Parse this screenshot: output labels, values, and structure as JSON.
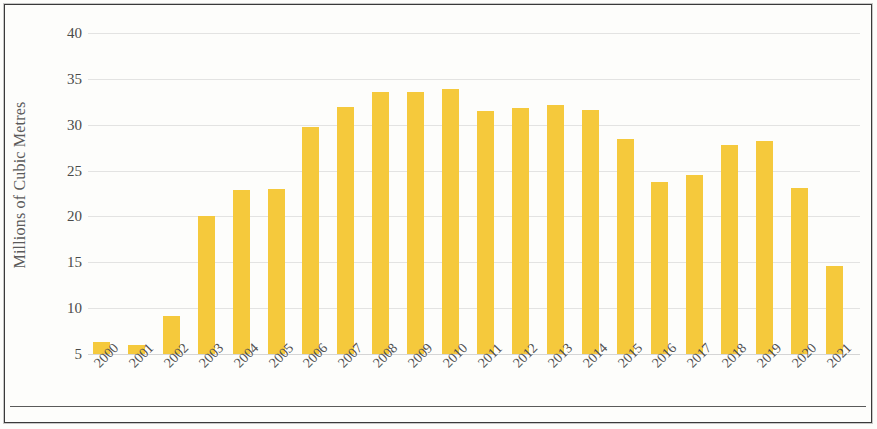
{
  "chart_data": {
    "type": "bar",
    "title": "",
    "xlabel": "",
    "ylabel": "Millions of Cubic Metres",
    "categories": [
      "2000",
      "2001",
      "2002",
      "2003",
      "2004",
      "2005",
      "2006",
      "2007",
      "2008",
      "2009",
      "2010",
      "2011",
      "2012",
      "2013",
      "2014",
      "2015",
      "2016",
      "2017",
      "2018",
      "2019",
      "2020",
      "2021"
    ],
    "values": [
      6.3,
      6.0,
      9.1,
      20.1,
      22.9,
      23.0,
      29.7,
      31.9,
      33.6,
      33.6,
      33.9,
      31.5,
      31.8,
      32.2,
      31.6,
      28.4,
      23.8,
      24.5,
      27.8,
      28.2,
      23.1,
      14.6
    ],
    "ytick_labels": [
      "40",
      "35",
      "30",
      "25",
      "20",
      "15",
      "10",
      "5"
    ],
    "ytick_values": [
      40,
      35,
      30,
      25,
      20,
      15,
      10,
      5
    ],
    "ylim": [
      5,
      41.5
    ],
    "grid": true,
    "legend": false,
    "bar_color": "#f5c93c",
    "grid_color": "#d9d9d9",
    "axis_text_color": "#4a4a4a"
  }
}
